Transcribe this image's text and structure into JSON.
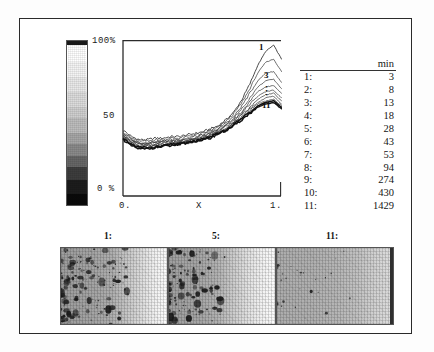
{
  "figure": {
    "title": "",
    "colorbar": {
      "name": "grayscale-intensity-scale",
      "orientation": "vertical",
      "top_color": "#ffffff",
      "bottom_color": "#0a0a0a"
    }
  },
  "plot": {
    "y_max_label": "100%",
    "y_mid_label": "50",
    "y_min_label": "0 %",
    "x_min_label": "0.",
    "x_axis_label": "X",
    "x_max_label": "1.",
    "curve_label_first": "1",
    "curve_label_second": "3",
    "curve_label_ellipsis": "·\n·\n·",
    "curve_label_last": "11"
  },
  "legend": {
    "index_header": "",
    "value_header": "min",
    "rows": [
      {
        "index": "1:",
        "value": "3"
      },
      {
        "index": "2:",
        "value": "8"
      },
      {
        "index": "3:",
        "value": "13"
      },
      {
        "index": "4:",
        "value": "18"
      },
      {
        "index": "5:",
        "value": "28"
      },
      {
        "index": "6:",
        "value": "43"
      },
      {
        "index": "7:",
        "value": "53"
      },
      {
        "index": "8:",
        "value": "94"
      },
      {
        "index": "9:",
        "value": "274"
      },
      {
        "index": "10:",
        "value": "430"
      },
      {
        "index": "11:",
        "value": "1429"
      }
    ]
  },
  "panels": [
    {
      "caption": "1:"
    },
    {
      "caption": "5:"
    },
    {
      "caption": "11:"
    }
  ],
  "chart_data": {
    "type": "line",
    "title": "",
    "xlabel": "X",
    "ylabel": "%",
    "xlim": [
      0,
      1
    ],
    "ylim": [
      0,
      100
    ],
    "xticks": [
      "0.",
      "1."
    ],
    "yticks": [
      "0 %",
      "50",
      "100%"
    ],
    "grid": false,
    "legend_position": "right-table",
    "legend_unit": "min",
    "annotations": [
      "1",
      "3",
      "···",
      "11"
    ],
    "x": [
      0.0,
      0.05,
      0.1,
      0.15,
      0.2,
      0.25,
      0.3,
      0.35,
      0.4,
      0.45,
      0.5,
      0.55,
      0.6,
      0.65,
      0.7,
      0.75,
      0.8,
      0.85,
      0.9,
      0.95,
      1.0
    ],
    "series": [
      {
        "name": "1",
        "time_min": 3,
        "values": [
          42,
          38,
          36,
          36,
          37,
          37,
          38,
          38,
          39,
          40,
          41,
          43,
          45,
          49,
          54,
          62,
          72,
          84,
          93,
          97,
          88
        ]
      },
      {
        "name": "2",
        "time_min": 8,
        "values": [
          41,
          37,
          35,
          35,
          36,
          36,
          37,
          37,
          38,
          39,
          40,
          42,
          44,
          48,
          53,
          60,
          69,
          79,
          86,
          88,
          80
        ]
      },
      {
        "name": "3",
        "time_min": 13,
        "values": [
          40,
          36,
          34,
          34,
          35,
          35,
          36,
          36,
          37,
          38,
          39,
          41,
          43,
          47,
          51,
          58,
          66,
          74,
          79,
          80,
          73
        ]
      },
      {
        "name": "4",
        "time_min": 18,
        "values": [
          39,
          36,
          34,
          34,
          34,
          35,
          35,
          36,
          36,
          37,
          39,
          40,
          43,
          46,
          50,
          56,
          63,
          70,
          74,
          75,
          69
        ]
      },
      {
        "name": "5",
        "time_min": 28,
        "values": [
          39,
          35,
          33,
          33,
          34,
          34,
          35,
          35,
          36,
          37,
          38,
          40,
          42,
          45,
          49,
          54,
          61,
          67,
          70,
          71,
          66
        ]
      },
      {
        "name": "6",
        "time_min": 43,
        "values": [
          38,
          35,
          33,
          33,
          33,
          34,
          34,
          35,
          35,
          36,
          38,
          39,
          42,
          45,
          48,
          53,
          59,
          64,
          67,
          68,
          63
        ]
      },
      {
        "name": "7",
        "time_min": 53,
        "values": [
          38,
          34,
          32,
          32,
          33,
          33,
          34,
          34,
          35,
          36,
          37,
          39,
          41,
          44,
          47,
          52,
          57,
          62,
          65,
          66,
          61
        ]
      },
      {
        "name": "8",
        "time_min": 94,
        "values": [
          37,
          34,
          32,
          32,
          32,
          33,
          33,
          34,
          35,
          36,
          37,
          38,
          41,
          43,
          47,
          51,
          56,
          60,
          63,
          64,
          59
        ]
      },
      {
        "name": "9",
        "time_min": 274,
        "values": [
          37,
          33,
          31,
          31,
          32,
          32,
          33,
          34,
          34,
          35,
          36,
          38,
          40,
          43,
          46,
          50,
          55,
          59,
          61,
          62,
          58
        ]
      },
      {
        "name": "10",
        "time_min": 430,
        "values": [
          36,
          33,
          31,
          31,
          31,
          32,
          33,
          33,
          34,
          35,
          36,
          38,
          40,
          42,
          46,
          50,
          54,
          58,
          60,
          61,
          57
        ]
      },
      {
        "name": "11",
        "time_min": 1429,
        "values": [
          36,
          32,
          30,
          30,
          31,
          32,
          32,
          33,
          34,
          35,
          36,
          37,
          40,
          42,
          45,
          49,
          53,
          57,
          59,
          60,
          56
        ]
      }
    ]
  }
}
